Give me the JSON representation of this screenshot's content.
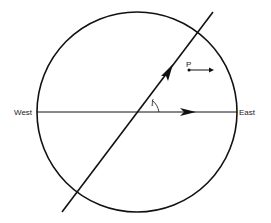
{
  "diagram": {
    "labels": {
      "west": "West",
      "east": "East",
      "point": "P",
      "angle": "i"
    },
    "colors": {
      "stroke": "#111111",
      "background": "#ffffff"
    }
  }
}
